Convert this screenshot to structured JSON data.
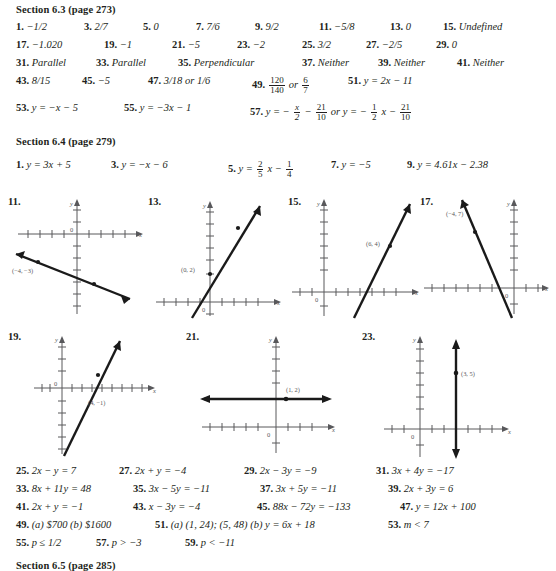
{
  "sections": [
    {
      "id": "sec-6-3",
      "heading": "Section 6.3 (page 273)",
      "rows": [
        {
          "items": [
            {
              "num": "1.",
              "val": "−1/2",
              "x": 16
            },
            {
              "num": "3.",
              "val": "2/7",
              "x": 84
            },
            {
              "num": "5.",
              "val": "0",
              "x": 143
            },
            {
              "num": "7.",
              "val": "7/6",
              "x": 196
            },
            {
              "num": "9.",
              "val": "9/2",
              "x": 255
            },
            {
              "num": "11.",
              "val": "−5/8",
              "x": 319
            },
            {
              "num": "13.",
              "val": "0",
              "x": 390
            },
            {
              "num": "15.",
              "val": "Undefined",
              "x": 443
            }
          ]
        },
        {
          "items": [
            {
              "num": "17.",
              "val": "−1.020",
              "x": 16
            },
            {
              "num": "19.",
              "val": "−1",
              "x": 104
            },
            {
              "num": "21.",
              "val": "−5",
              "x": 172
            },
            {
              "num": "23.",
              "val": "−2",
              "x": 237
            },
            {
              "num": "25.",
              "val": "3/2",
              "x": 302
            },
            {
              "num": "27.",
              "val": "−2/5",
              "x": 366
            },
            {
              "num": "29.",
              "val": "0",
              "x": 436
            }
          ]
        },
        {
          "items": [
            {
              "num": "31.",
              "val": "Parallel",
              "x": 16
            },
            {
              "num": "33.",
              "val": "Parallel",
              "x": 96
            },
            {
              "num": "35.",
              "val": "Perpendicular",
              "x": 178
            },
            {
              "num": "37.",
              "val": "Neither",
              "x": 302
            },
            {
              "num": "39.",
              "val": "Neither",
              "x": 378
            },
            {
              "num": "41.",
              "val": "Neither",
              "x": 457
            }
          ]
        },
        {
          "items": [
            {
              "num": "43.",
              "val": "8/15",
              "x": 16
            },
            {
              "num": "45.",
              "val": "−5",
              "x": 82
            },
            {
              "num": "47.",
              "val": "3/18 or 1/6",
              "x": 148
            },
            {
              "num": "49.",
              "val": "FRAC:120/140 or FRAC:6/7",
              "x": 252
            },
            {
              "num": "51.",
              "val": "y = 2x − 11",
              "x": 348
            }
          ]
        },
        {
          "items": [
            {
              "num": "53.",
              "val": "y = −x − 5",
              "x": 16
            },
            {
              "num": "55.",
              "val": "y = −3x − 1",
              "x": 124
            },
            {
              "num": "57.",
              "val": "y = − FRAC:x/2 − FRAC:21/10 or y = − FRAC:1/2 x − FRAC:21/10",
              "x": 250
            }
          ]
        }
      ]
    },
    {
      "id": "sec-6-4",
      "heading": "Section 6.4 (page 279)",
      "rows": [
        {
          "items": [
            {
              "num": "1.",
              "val": "y = 3x + 5",
              "x": 16
            },
            {
              "num": "3.",
              "val": "y = −x − 6",
              "x": 111
            },
            {
              "num": "5.",
              "val": "y = FRAC:2/5 x − FRAC:1/4",
              "x": 228
            },
            {
              "num": "7.",
              "val": "y = −5",
              "x": 331
            },
            {
              "num": "9.",
              "val": "y = 4.61x − 2.38",
              "x": 407
            }
          ]
        }
      ]
    },
    {
      "id": "sec-6-4-tail",
      "rows": [
        {
          "items": [
            {
              "num": "25.",
              "val": "2x − y = 7",
              "x": 16
            },
            {
              "num": "27.",
              "val": "2x + y = −4",
              "x": 119
            },
            {
              "num": "29.",
              "val": "2x − 3y = −9",
              "x": 244
            },
            {
              "num": "31.",
              "val": "3x + 4y = −17",
              "x": 376
            }
          ]
        },
        {
          "items": [
            {
              "num": "33.",
              "val": "8x + 11y = 48",
              "x": 16
            },
            {
              "num": "35.",
              "val": "3x − 5y = −11",
              "x": 133
            },
            {
              "num": "37.",
              "val": "3x + 5y = −11",
              "x": 260
            },
            {
              "num": "39.",
              "val": "2x + 3y = 6",
              "x": 388
            }
          ]
        },
        {
          "items": [
            {
              "num": "41.",
              "val": "2x + y = −1",
              "x": 16
            },
            {
              "num": "43.",
              "val": "x − 3y = −4",
              "x": 133
            },
            {
              "num": "45.",
              "val": "88x − 72y = −133",
              "x": 257
            },
            {
              "num": "47.",
              "val": "y = 12x + 100",
              "x": 400
            }
          ]
        },
        {
          "items": [
            {
              "num": "49.",
              "val": "(a) $700   (b) $1600",
              "x": 16
            },
            {
              "num": "51.",
              "val": "(a) (1, 24); (5, 48)   (b) y = 6x + 18",
              "x": 155
            },
            {
              "num": "53.",
              "val": "m < 7",
              "x": 388
            }
          ]
        },
        {
          "items": [
            {
              "num": "55.",
              "val": "p ≤ 1/2",
              "x": 16
            },
            {
              "num": "57.",
              "val": "p > −3",
              "x": 96
            },
            {
              "num": "59.",
              "val": "p < −11",
              "x": 185
            }
          ]
        }
      ]
    },
    {
      "id": "sec-6-5",
      "heading": "Section 6.5 (page 285)",
      "rows": []
    }
  ],
  "graphs": [
    {
      "label": "11.",
      "point_label": "(−4, −3)",
      "axis_x_label": "x",
      "axis_y_label": "y",
      "origin_label": "0"
    },
    {
      "label": "13.",
      "point_label": "(0, 2)",
      "axis_x_label": "x",
      "axis_y_label": "y",
      "origin_label": "0"
    },
    {
      "label": "15.",
      "point_label": "(6, 4)",
      "axis_x_label": "x",
      "axis_y_label": "y",
      "origin_label": "0"
    },
    {
      "label": "17.",
      "point_label": "(−4, 7)",
      "axis_x_label": "x",
      "axis_y_label": "y",
      "origin_label": "0"
    },
    {
      "label": "19.",
      "point_label": "(4, −1)",
      "axis_x_label": "x",
      "axis_y_label": "y",
      "origin_label": "0"
    },
    {
      "label": "21.",
      "point_label": "(1, 2)",
      "axis_x_label": "x",
      "axis_y_label": "y",
      "origin_label": "0"
    },
    {
      "label": "23.",
      "point_label": "(3, 5)",
      "axis_x_label": "x",
      "axis_y_label": "y",
      "origin_label": "0"
    }
  ]
}
